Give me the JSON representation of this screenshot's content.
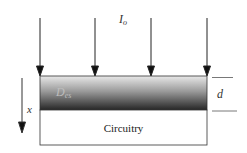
{
  "diagram": {
    "incident_light": {
      "label_main": "I",
      "label_sub": "o",
      "arrow_count": 4,
      "arrow_color": "#222222"
    },
    "layer": {
      "label_main": "D",
      "label_sub": "es",
      "gradient_top": "#e6e6e6",
      "gradient_bottom": "#2a2a2a"
    },
    "thickness": {
      "label": "d"
    },
    "depth_axis": {
      "label": "x"
    },
    "substrate": {
      "label": "Circuitry",
      "fill": "#ffffff"
    }
  }
}
